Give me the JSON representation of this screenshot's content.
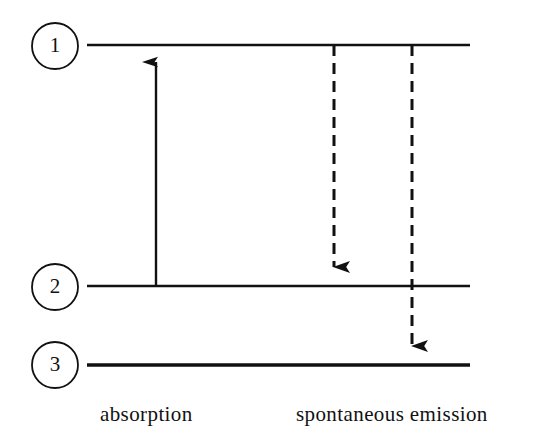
{
  "figure": {
    "kind": "energy-level-diagram",
    "background_color": "#ffffff",
    "ink_color": "#111111"
  },
  "levels": [
    {
      "id": "level-1",
      "label": "1",
      "line": {
        "x1": 87,
        "x2": 470,
        "y": 45,
        "thickness": 2.6
      },
      "badge": {
        "cx": 55,
        "cy": 46,
        "r": 23
      }
    },
    {
      "id": "level-2",
      "label": "2",
      "line": {
        "x1": 87,
        "x2": 470,
        "y": 286,
        "thickness": 2.4
      },
      "badge": {
        "cx": 55,
        "cy": 287,
        "r": 23
      }
    },
    {
      "id": "level-3",
      "label": "3",
      "line": {
        "x1": 87,
        "x2": 470,
        "y": 365,
        "thickness": 3.4
      },
      "badge": {
        "cx": 55,
        "cy": 365,
        "r": 23
      }
    }
  ],
  "transitions": [
    {
      "id": "absorption-arrow",
      "name": "absorption",
      "style": "solid",
      "direction": "up",
      "from_level": "2",
      "to_level": "1",
      "x": 156,
      "y_start": 287,
      "y_end": 48
    },
    {
      "id": "spontaneous-emission-arrow-1-to-2",
      "name": "spontaneous emission 1 to 2",
      "style": "dashed",
      "direction": "down",
      "from_level": "1",
      "to_level": "2",
      "x": 334,
      "y_start": 45,
      "y_end": 284
    },
    {
      "id": "spontaneous-emission-arrow-1-to-3",
      "name": "spontaneous emission 1 to 3",
      "style": "dashed",
      "direction": "down",
      "from_level": "1",
      "to_level": "3",
      "x": 412,
      "y_start": 45,
      "y_end": 363
    }
  ],
  "captions": [
    {
      "id": "caption-absorption",
      "text": "absorption",
      "x": 100,
      "y": 421
    },
    {
      "id": "caption-spontaneous-emission",
      "text": "spontaneous emission",
      "x": 296,
      "y": 421
    }
  ]
}
